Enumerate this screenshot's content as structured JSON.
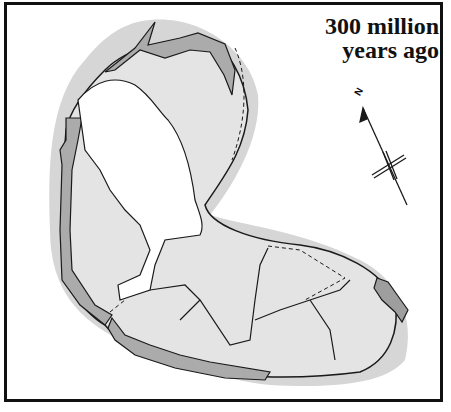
{
  "title": {
    "line1": "300 million",
    "line2": "years ago"
  },
  "compass": {
    "label": "N",
    "icon": "north-arrow-icon"
  },
  "colors": {
    "ocean_shelf": "#d4d4d4",
    "land": "#e2e2e2",
    "mountain_belt": "#a8a8a8",
    "inland_sea": "#ffffff",
    "outline": "#1a1a1a",
    "frame": "#111111"
  }
}
